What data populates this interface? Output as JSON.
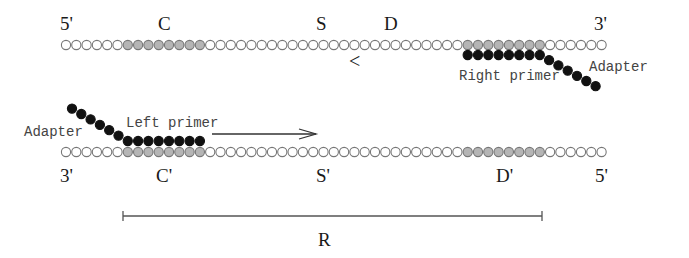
{
  "diagram": {
    "top_strand": {
      "end_left": "5'",
      "end_right": "3'",
      "region_labels": [
        "C",
        "S",
        "D"
      ],
      "reverse_marker": "<"
    },
    "bottom_strand": {
      "end_left": "3'",
      "end_right": "5'",
      "region_labels": [
        "C'",
        "S'",
        "D'"
      ]
    },
    "right_primer": {
      "label": "Right primer",
      "adapter_label": "Adapter"
    },
    "left_primer": {
      "label": "Left primer",
      "adapter_label": "Adapter"
    },
    "range": {
      "label": "R"
    },
    "colors": {
      "open_circle_fill": "#ffffff",
      "open_circle_stroke": "#777777",
      "shaded_circle_fill": "#b5b5b5",
      "primer_circle_fill": "#111111",
      "line": "#555555"
    },
    "geometry": {
      "strand_start_x": 66,
      "circle_pitch": 10.3,
      "circle_count": 53,
      "top_shaded_ranges": [
        [
          6,
          13
        ],
        [
          39,
          46
        ]
      ],
      "bottom_shaded_ranges": [
        [
          6,
          13
        ],
        [
          39,
          46
        ]
      ]
    }
  }
}
